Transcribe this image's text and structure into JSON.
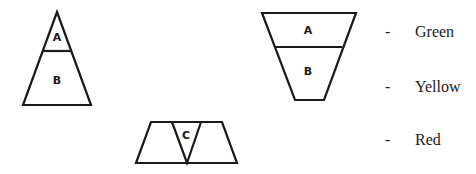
{
  "shapes": {
    "triangle": {
      "labels": [
        "A",
        "B"
      ]
    },
    "inverted_trapezoid": {
      "labels": [
        "A",
        "B"
      ]
    },
    "split_trapezoid": {
      "labels": [
        "C"
      ]
    }
  },
  "legend": {
    "items": [
      {
        "marker": "-",
        "label": "Green"
      },
      {
        "marker": "-",
        "label": "Yellow"
      },
      {
        "marker": "-",
        "label": "Red"
      }
    ]
  }
}
